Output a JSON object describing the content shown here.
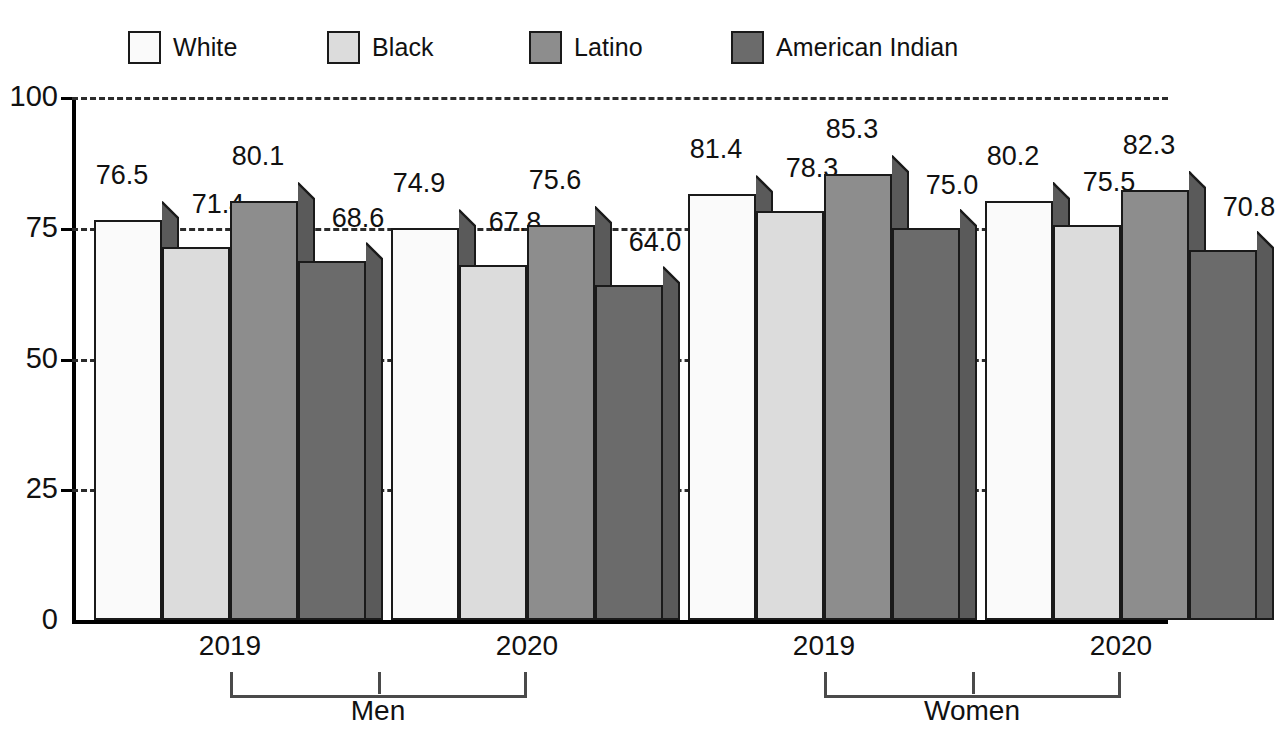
{
  "chart_data": {
    "type": "bar",
    "title": "",
    "subtitle": "",
    "xlabel": "",
    "ylabel": "",
    "ylim": [
      0,
      100
    ],
    "yticks": [
      0,
      25,
      50,
      75,
      100
    ],
    "ytick_labels": [
      "0",
      "25",
      "50",
      "75",
      "100"
    ],
    "grid": "horizontal-dashed",
    "legend_position": "top",
    "categories": [
      "Men 2019",
      "Men 2020",
      "Women 2019",
      "Women 2020"
    ],
    "group_labels": [
      "Men",
      "Women"
    ],
    "year_labels": [
      "2019",
      "2020",
      "2019",
      "2020"
    ],
    "series": [
      {
        "name": "White",
        "color": "#fafafa",
        "values": [
          76.5,
          74.9,
          81.4,
          80.2
        ]
      },
      {
        "name": "Black",
        "color": "#dcdcdc",
        "values": [
          71.4,
          67.8,
          78.3,
          75.5
        ]
      },
      {
        "name": "Latino",
        "color": "#8d8d8d",
        "values": [
          80.1,
          75.6,
          85.3,
          82.3
        ]
      },
      {
        "name": "American Indian",
        "color": "#6b6b6b",
        "values": [
          68.6,
          64.0,
          75.0,
          70.8
        ]
      }
    ]
  },
  "legend": {
    "items": [
      {
        "label": "White",
        "color": "#fafafa",
        "left": 128,
        "icon": "legend-swatch-white"
      },
      {
        "label": "Black",
        "color": "#dcdcdc",
        "left": 327,
        "icon": "legend-swatch-black"
      },
      {
        "label": "Latino",
        "color": "#8d8d8d",
        "left": 529,
        "icon": "legend-swatch-latino"
      },
      {
        "label": "American Indian",
        "color": "#6b6b6b",
        "left": 731,
        "icon": "legend-swatch-american-indian"
      }
    ]
  },
  "axes": {
    "y_ticks": [
      {
        "label": "100",
        "value": 100
      },
      {
        "label": "75",
        "value": 75
      },
      {
        "label": "50",
        "value": 50
      },
      {
        "label": "25",
        "value": 25
      },
      {
        "label": "0",
        "value": 0
      }
    ],
    "x_groups": [
      {
        "label": "Men",
        "years": [
          "2019",
          "2020"
        ]
      },
      {
        "label": "Women",
        "years": [
          "2019",
          "2020"
        ]
      }
    ]
  },
  "bars": [
    {
      "group": "Men",
      "year": "2019",
      "series": "White",
      "value": 76.5,
      "label": "76.5",
      "fill": "#fafafa",
      "left": 22,
      "width": 68,
      "label_left": -6,
      "label_top": -34
    },
    {
      "group": "Men",
      "year": "2019",
      "series": "Black",
      "value": 71.4,
      "label": "71.4",
      "fill": "#dcdcdc",
      "left": 90,
      "width": 68,
      "label_left": 22,
      "label_top": -32
    },
    {
      "group": "Men",
      "year": "2019",
      "series": "Latino",
      "value": 80.1,
      "label": "80.1",
      "fill": "#8d8d8d",
      "left": 158,
      "width": 68,
      "label_left": -6,
      "label_top": -34
    },
    {
      "group": "Men",
      "year": "2019",
      "series": "American Indian",
      "value": 68.6,
      "label": "68.6",
      "fill": "#6b6b6b",
      "left": 226,
      "width": 68,
      "label_left": 26,
      "label_top": -32
    },
    {
      "group": "Men",
      "year": "2020",
      "series": "White",
      "value": 74.9,
      "label": "74.9",
      "fill": "#fafafa",
      "left": 319,
      "width": 68,
      "label_left": -6,
      "label_top": -34
    },
    {
      "group": "Men",
      "year": "2020",
      "series": "Black",
      "value": 67.8,
      "label": "67.8",
      "fill": "#dcdcdc",
      "left": 387,
      "width": 68,
      "label_left": 22,
      "label_top": -32
    },
    {
      "group": "Men",
      "year": "2020",
      "series": "Latino",
      "value": 75.6,
      "label": "75.6",
      "fill": "#8d8d8d",
      "left": 455,
      "width": 68,
      "label_left": -6,
      "label_top": -34
    },
    {
      "group": "Men",
      "year": "2020",
      "series": "American Indian",
      "value": 64.0,
      "label": "64.0",
      "fill": "#6b6b6b",
      "left": 523,
      "width": 68,
      "label_left": 26,
      "label_top": -32
    },
    {
      "group": "Women",
      "year": "2019",
      "series": "White",
      "value": 81.4,
      "label": "81.4",
      "fill": "#fafafa",
      "left": 616,
      "width": 68,
      "label_left": -6,
      "label_top": -34
    },
    {
      "group": "Women",
      "year": "2019",
      "series": "Black",
      "value": 78.3,
      "label": "78.3",
      "fill": "#dcdcdc",
      "left": 684,
      "width": 68,
      "label_left": 22,
      "label_top": -32
    },
    {
      "group": "Women",
      "year": "2019",
      "series": "Latino",
      "value": 85.3,
      "label": "85.3",
      "fill": "#8d8d8d",
      "left": 752,
      "width": 68,
      "label_left": -6,
      "label_top": -34
    },
    {
      "group": "Women",
      "year": "2019",
      "series": "American Indian",
      "value": 75.0,
      "label": "75.0",
      "fill": "#6b6b6b",
      "left": 820,
      "width": 68,
      "label_left": 26,
      "label_top": -32
    },
    {
      "group": "Women",
      "year": "2020",
      "series": "White",
      "value": 80.2,
      "label": "80.2",
      "fill": "#fafafa",
      "left": 913,
      "width": 68,
      "label_left": -6,
      "label_top": -34
    },
    {
      "group": "Women",
      "year": "2020",
      "series": "Black",
      "value": 75.5,
      "label": "75.5",
      "fill": "#dcdcdc",
      "left": 981,
      "width": 68,
      "label_left": 22,
      "label_top": -32
    },
    {
      "group": "Women",
      "year": "2020",
      "series": "Latino",
      "value": 82.3,
      "label": "82.3",
      "fill": "#8d8d8d",
      "left": 1049,
      "width": 68,
      "label_left": -6,
      "label_top": -34
    },
    {
      "group": "Women",
      "year": "2020",
      "series": "American Indian",
      "value": 70.8,
      "label": "70.8",
      "fill": "#6b6b6b",
      "left": 1117,
      "width": 68,
      "label_left": 26,
      "label_top": -32
    }
  ],
  "x_axis_items": [
    {
      "label": "2019",
      "center": 158
    },
    {
      "label": "2020",
      "center": 455
    },
    {
      "label": "2019",
      "center": 752
    },
    {
      "label": "2020",
      "center": 1049
    }
  ],
  "group_brackets": [
    {
      "label": "Men",
      "start": 158,
      "end": 455,
      "center": 306
    },
    {
      "label": "Women",
      "start": 752,
      "end": 1049,
      "center": 900
    }
  ]
}
